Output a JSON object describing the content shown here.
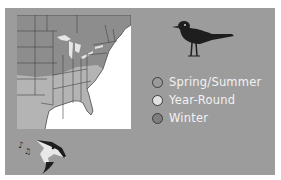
{
  "figure": {
    "panel_color": "#9c9c9c",
    "map": {
      "region": "Eastern United States",
      "ocean_color": "#ffffff",
      "land_color": "#8f8f8f",
      "range_colors": {
        "spring_summer": "#8f8f8f",
        "year_round": "#d8d8d8",
        "winter": "#7a7a7a"
      }
    },
    "bird_icon": "bird-silhouette-icon",
    "song_icon": "singing-bird-head-icon",
    "legend": {
      "items": [
        {
          "label": "Spring/Summer",
          "color": "#9a9a9a"
        },
        {
          "label": "Year-Round",
          "color": "#e2e2e2"
        },
        {
          "label": "Winter",
          "color": "#7e7e7e"
        }
      ]
    }
  }
}
